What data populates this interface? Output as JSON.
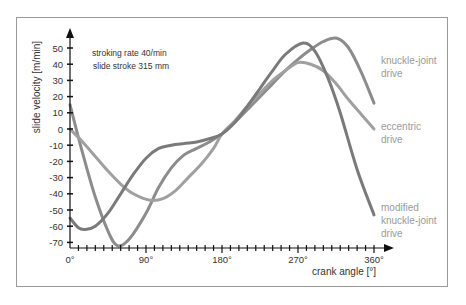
{
  "chart_data": {
    "type": "line",
    "title": "",
    "xlabel": "crank angle  [°]",
    "ylabel": "slide velocity  [m/min]",
    "xlim": [
      0,
      360
    ],
    "ylim": [
      -70,
      50
    ],
    "x_ticks": [
      0,
      90,
      180,
      270,
      360
    ],
    "x_tick_labels": [
      "0°",
      "90°",
      "180°",
      "270°",
      "360°"
    ],
    "x_minor_step": 10,
    "y_ticks": [
      50,
      40,
      30,
      20,
      10,
      0,
      -10,
      -20,
      -30,
      -40,
      -50,
      -60,
      -70
    ],
    "y_tick_labels": [
      "50",
      "40",
      "30",
      "20",
      "10",
      "0",
      "-10",
      "-20",
      "-30",
      "-40",
      "-50",
      "-60",
      "-70"
    ],
    "grid": false,
    "annotations": [
      "stroking rate  40/min",
      "slide stroke  315 mm"
    ],
    "legend_position": "right, inline labels at curve ends",
    "series": [
      {
        "name": "knuckle-joint drive",
        "color": "#8c8c8c",
        "x": [
          0,
          15,
          30,
          45,
          56,
          70,
          90,
          105,
          120,
          135,
          150,
          165,
          180,
          195,
          210,
          225,
          240,
          255,
          270,
          285,
          300,
          316,
          330,
          345,
          360
        ],
        "values": [
          15,
          -15,
          -42,
          -63,
          -72,
          -68,
          -52,
          -36,
          -24,
          -16,
          -12,
          -8,
          -3,
          4,
          12,
          20,
          28,
          36,
          43,
          49,
          54,
          56,
          50,
          35,
          16
        ]
      },
      {
        "name": "eccentric drive",
        "color": "#a0a0a0",
        "x": [
          0,
          15,
          30,
          45,
          60,
          75,
          95,
          110,
          125,
          140,
          155,
          170,
          180,
          195,
          210,
          225,
          240,
          255,
          270,
          285,
          300,
          315,
          330,
          345,
          360
        ],
        "values": [
          0,
          -8,
          -17,
          -26,
          -34,
          -40,
          -44,
          -43,
          -38,
          -30,
          -22,
          -12,
          -3,
          5,
          14,
          22,
          30,
          36,
          41,
          40,
          36,
          28,
          18,
          9,
          0
        ]
      },
      {
        "name": "modified knuckle-joint drive",
        "color": "#7a7a7a",
        "x": [
          0,
          10,
          18,
          30,
          45,
          60,
          75,
          90,
          105,
          120,
          135,
          150,
          165,
          180,
          195,
          210,
          225,
          240,
          255,
          276,
          290,
          305,
          320,
          340,
          360
        ],
        "values": [
          -55,
          -61,
          -62,
          -60,
          -52,
          -40,
          -28,
          -18,
          -12,
          -10,
          -9,
          -8,
          -6,
          -3,
          4,
          14,
          25,
          36,
          46,
          53,
          48,
          32,
          10,
          -25,
          -53
        ]
      }
    ]
  },
  "labels": {
    "knuckle": [
      "knuckle-joint",
      "drive"
    ],
    "eccentric": [
      "eccentric",
      "drive"
    ],
    "modified": [
      "modified",
      "knuckle-joint",
      "drive"
    ]
  },
  "colors": {
    "axis": "#111111",
    "frame": "#9a9a9a",
    "tick_text": "#333333",
    "label_text": "#9a9a9a"
  }
}
